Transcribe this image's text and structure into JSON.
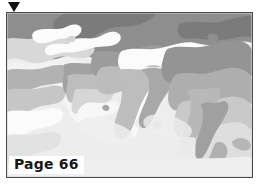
{
  "figure": {
    "marker_icon": "down-triangle-marker",
    "caption": "Page 66",
    "frame_border_color": "#4a4a4a",
    "background_color": "#ffffff"
  },
  "map": {
    "title": "Page 66",
    "region": "Eurasia, Middle East, South Asia and Southeast Asia",
    "style": "grayscale thematic climate / vegetation zone map",
    "projection_note": "equirectangular land and sea zone shading",
    "palette": {
      "ocean": "#ededed",
      "lightest": "#fbfbfb",
      "light": "#dcdcdc",
      "mid_light": "#c8c8c8",
      "mid": "#b4b4b4",
      "mid_dark": "#9e9e9e",
      "dark": "#8a8a8a",
      "darkest": "#787878",
      "outline": "#6f6f6f"
    },
    "zone_legend": [
      {
        "id": "zone-ocean",
        "label": "Ocean / water",
        "color": "#ededed"
      },
      {
        "id": "zone-white",
        "label": "Arid / desert",
        "color": "#fbfbfb"
      },
      {
        "id": "zone-light",
        "label": "Semi-arid / steppe",
        "color": "#dcdcdc"
      },
      {
        "id": "zone-midlight",
        "label": "Temperate grassland",
        "color": "#c8c8c8"
      },
      {
        "id": "zone-mid",
        "label": "Temperate mixed",
        "color": "#b4b4b4"
      },
      {
        "id": "zone-middark",
        "label": "Boreal / montane",
        "color": "#9e9e9e"
      },
      {
        "id": "zone-dark",
        "label": "Cool humid",
        "color": "#8a8a8a"
      },
      {
        "id": "zone-darkest",
        "label": "Polar / tundra",
        "color": "#787878"
      }
    ]
  }
}
